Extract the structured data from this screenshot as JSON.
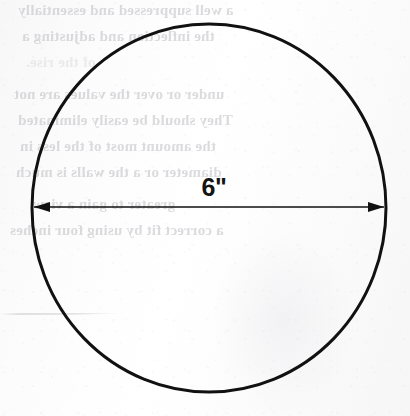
{
  "page": {
    "kind": "scanned-textbook-figure",
    "width": 410,
    "height": 416,
    "paper_color": "#fdfdfd",
    "ink_color": "#111111"
  },
  "figure": {
    "name": "circle-with-diameter-dimension",
    "shape": "circle",
    "dimension_label": "6\"",
    "dimension_value": 6,
    "dimension_unit": "inch",
    "dimension_kind": "diameter",
    "arrow_style": "double-headed",
    "stroke_color": "#111111",
    "geometry": {
      "center_x": 209,
      "center_y": 208,
      "radius_x": 177,
      "radius_y": 184,
      "stroke_width": 3,
      "dimension_line_y": 207,
      "dimension_line_x1": 34,
      "dimension_line_x2": 384,
      "dimension_line_width": 1.6,
      "arrowhead_length": 16,
      "arrowhead_half_height": 5,
      "label_x": 214,
      "label_y": 187
    }
  },
  "bleed_through_text": {
    "note": "faint mirrored show-through from the reverse side of the scanned page",
    "color": "#b9b9bf",
    "lines": [
      {
        "text": "a well suppressed and essentially",
        "x": 18,
        "y": 2,
        "size": 15,
        "faint": false
      },
      {
        "text": "the inflection and adjusting a",
        "x": 22,
        "y": 28,
        "size": 15,
        "faint": false
      },
      {
        "text": "of the rise.",
        "x": 26,
        "y": 54,
        "size": 15,
        "faint": true
      },
      {
        "text": "under or over the values are not",
        "x": 14,
        "y": 86,
        "size": 15,
        "faint": false
      },
      {
        "text": "They should be easily eliminated",
        "x": 18,
        "y": 112,
        "size": 15,
        "faint": false
      },
      {
        "text": "the amount most of the less in",
        "x": 20,
        "y": 138,
        "size": 15,
        "faint": false
      },
      {
        "text": "diameter or a the walls is much",
        "x": 16,
        "y": 164,
        "size": 15,
        "faint": false
      },
      {
        "text": "greater to gain a view.",
        "x": 30,
        "y": 196,
        "size": 15,
        "faint": false
      },
      {
        "text": "a correct fit by using four inches",
        "x": 10,
        "y": 222,
        "size": 15,
        "faint": false
      }
    ],
    "rules": [
      {
        "x": 0,
        "y": 313,
        "width": 120
      },
      {
        "x": 0,
        "y": 314,
        "width": 96
      }
    ]
  }
}
